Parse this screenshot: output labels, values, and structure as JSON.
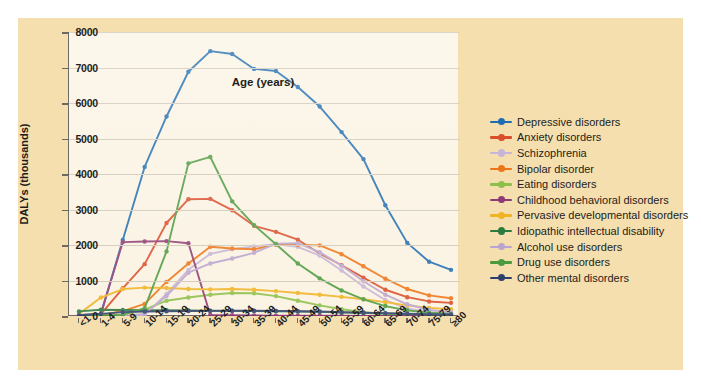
{
  "figure": {
    "background_color": "#f6dfae",
    "plot_background_color": "#fbf4e5",
    "axis_color": "#6d6a63",
    "grid_color": "#cfc8b8"
  },
  "chart_data": {
    "type": "line",
    "title": "",
    "xlabel": "Age (years)",
    "ylabel": "DALYs (thousands)",
    "categories": [
      "<1",
      "1-4",
      "5-9",
      "10-14",
      "15-19",
      "20-24",
      "25-29",
      "30-34",
      "35-39",
      "40-44",
      "45-49",
      "50-54",
      "55-59",
      "60-64",
      "65-69",
      "70-74",
      "75-79",
      "≥80"
    ],
    "ylim": [
      0,
      8000
    ],
    "yticks": [
      0,
      1000,
      2000,
      3000,
      4000,
      5000,
      6000,
      7000,
      8000
    ],
    "ytick_labels": [
      "0",
      "1000",
      "2000",
      "3000",
      "4000",
      "5000",
      "6000",
      "7000",
      "8000"
    ],
    "grid": true,
    "legend_position": "right",
    "markers": true,
    "series": [
      {
        "name": "Depressive disorders",
        "color": "#1f6cb0",
        "values": [
          30,
          60,
          2140,
          4200,
          5620,
          6880,
          7460,
          7380,
          6960,
          6900,
          6450,
          5900,
          5180,
          4420,
          3120,
          2060,
          1530,
          1300
        ]
      },
      {
        "name": "Anxiety disorders",
        "color": "#d94e2c",
        "values": [
          20,
          55,
          780,
          1460,
          2620,
          3290,
          3300,
          2980,
          2540,
          2370,
          2150,
          1760,
          1430,
          1080,
          740,
          530,
          410,
          370
        ]
      },
      {
        "name": "Schizophrenia",
        "color": "#c6b5d6",
        "values": [
          0,
          0,
          10,
          30,
          620,
          1300,
          1750,
          1880,
          1960,
          2020,
          1950,
          1700,
          1280,
          830,
          450,
          210,
          110,
          70
        ]
      },
      {
        "name": "Bipolar disorder",
        "color": "#ee7518",
        "values": [
          0,
          20,
          140,
          340,
          960,
          1480,
          1950,
          1900,
          1880,
          2010,
          2000,
          1990,
          1740,
          1400,
          1050,
          760,
          580,
          500
        ]
      },
      {
        "name": "Eating disorders",
        "color": "#8dc04a",
        "values": [
          0,
          5,
          20,
          180,
          430,
          520,
          600,
          650,
          640,
          560,
          430,
          300,
          190,
          110,
          60,
          30,
          15,
          10
        ]
      },
      {
        "name": "Childhood behavioral disorders",
        "color": "#8e3a74",
        "values": [
          0,
          60,
          2080,
          2100,
          2110,
          2050,
          30,
          20,
          15,
          10,
          8,
          6,
          5,
          4,
          3,
          2,
          2,
          1
        ]
      },
      {
        "name": "Pervasive developmental disorders",
        "color": "#f0b323",
        "values": [
          60,
          520,
          760,
          800,
          790,
          760,
          750,
          760,
          740,
          700,
          650,
          600,
          540,
          470,
          390,
          300,
          230,
          190
        ]
      },
      {
        "name": "Idiopathic intellectual disability",
        "color": "#2c7a3f",
        "values": [
          130,
          175,
          170,
          165,
          160,
          155,
          150,
          145,
          140,
          135,
          125,
          115,
          100,
          85,
          70,
          55,
          40,
          35
        ]
      },
      {
        "name": "Alcohol use disorders",
        "color": "#b9a4cf",
        "values": [
          0,
          0,
          5,
          60,
          560,
          1220,
          1480,
          1620,
          1780,
          2040,
          2050,
          1800,
          1420,
          980,
          600,
          330,
          170,
          110
        ]
      },
      {
        "name": "Drug use disorders",
        "color": "#4c9a3f",
        "values": [
          0,
          10,
          40,
          220,
          1820,
          4300,
          4480,
          3230,
          2560,
          2020,
          1480,
          1060,
          720,
          470,
          280,
          160,
          90,
          60
        ]
      },
      {
        "name": "Other mental disorders",
        "color": "#2e3f6e",
        "values": [
          20,
          60,
          110,
          125,
          135,
          140,
          145,
          150,
          150,
          145,
          135,
          125,
          110,
          95,
          80,
          65,
          50,
          45
        ]
      }
    ]
  }
}
